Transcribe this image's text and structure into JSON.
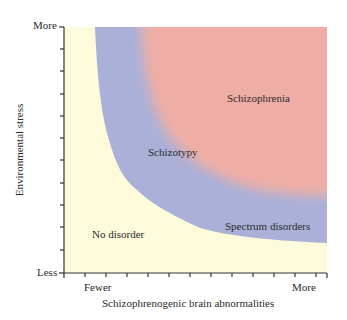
{
  "figure": {
    "y_axis": {
      "label": "Environmental stress",
      "top_label": "More",
      "bottom_label": "Less"
    },
    "x_axis": {
      "label": "Schizophrenogenic brain abnormalities",
      "left_label": "Fewer",
      "right_label": "More"
    },
    "regions": [
      {
        "name": "No disorder",
        "color": "#fdfbdc"
      },
      {
        "name": "Schizotypy",
        "color": "#aab0d8"
      },
      {
        "name": "Spectrum disorders",
        "color": "#aab0d8"
      },
      {
        "name": "Schizophrenia",
        "color": "#efaea5"
      }
    ],
    "colors": {
      "background": "#fdfbdc",
      "blue_band": "#aab0d8",
      "pink_core": "#efaea5",
      "axis": "#333333"
    }
  }
}
